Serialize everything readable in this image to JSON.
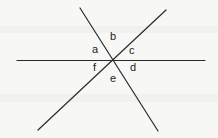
{
  "figure": {
    "background_color": "#f7f7f5",
    "stroke_color": "#2b2b2b",
    "label_color": "#1b1b1b",
    "stroke_width": 1.2,
    "intersection": {
      "x": 114,
      "y": 60.5
    },
    "lines": [
      {
        "name": "horizontal-line",
        "x1": 17,
        "y1": 60.5,
        "x2": 205,
        "y2": 60.5
      },
      {
        "name": "descending-diagonal-line",
        "x1": 80,
        "y1": 8,
        "x2": 158,
        "y2": 131
      },
      {
        "name": "ascending-diagonal-line",
        "x1": 38,
        "y1": 130,
        "x2": 166,
        "y2": 10
      }
    ],
    "labels": [
      {
        "id": "a",
        "text": "a",
        "x": 92,
        "y": 44
      },
      {
        "id": "b",
        "text": "b",
        "x": 110,
        "y": 31
      },
      {
        "id": "c",
        "text": "c",
        "x": 129,
        "y": 45
      },
      {
        "id": "d",
        "text": "d",
        "x": 130,
        "y": 62
      },
      {
        "id": "e",
        "text": "e",
        "x": 110,
        "y": 73
      },
      {
        "id": "f",
        "text": "f",
        "x": 93,
        "y": 62
      }
    ]
  }
}
